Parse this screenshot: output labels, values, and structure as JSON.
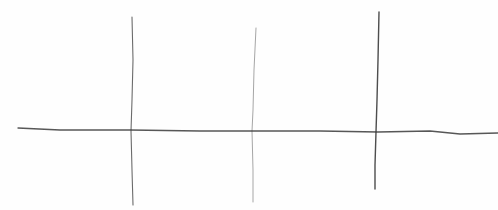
{
  "sketch": {
    "medium": "pencil",
    "background": "#fefefe",
    "stroke_color": "#3a3a3a",
    "horizontal_line": {
      "points": [
        [
          18,
          128
        ],
        [
          60,
          130
        ],
        [
          130,
          130
        ],
        [
          200,
          131
        ],
        [
          254,
          131
        ],
        [
          320,
          131
        ],
        [
          378,
          132
        ],
        [
          430,
          131
        ],
        [
          460,
          134
        ],
        [
          498,
          133
        ]
      ],
      "width": 1.3,
      "opacity": 0.85
    },
    "vertical_lines": [
      {
        "id": "left",
        "points": [
          [
            132,
            17
          ],
          [
            133,
            60
          ],
          [
            132,
            100
          ],
          [
            131,
            131
          ],
          [
            132,
            170
          ],
          [
            133,
            205
          ]
        ],
        "width": 1.1,
        "opacity": 0.75
      },
      {
        "id": "middle",
        "points": [
          [
            256,
            28
          ],
          [
            254,
            70
          ],
          [
            253,
            110
          ],
          [
            252,
            131
          ],
          [
            253,
            170
          ],
          [
            253,
            202
          ]
        ],
        "width": 0.9,
        "opacity": 0.5
      },
      {
        "id": "right",
        "points": [
          [
            379,
            12
          ],
          [
            378,
            60
          ],
          [
            377,
            100
          ],
          [
            376,
            132
          ],
          [
            375,
            165
          ],
          [
            375,
            189
          ]
        ],
        "width": 1.4,
        "opacity": 0.9
      }
    ]
  }
}
